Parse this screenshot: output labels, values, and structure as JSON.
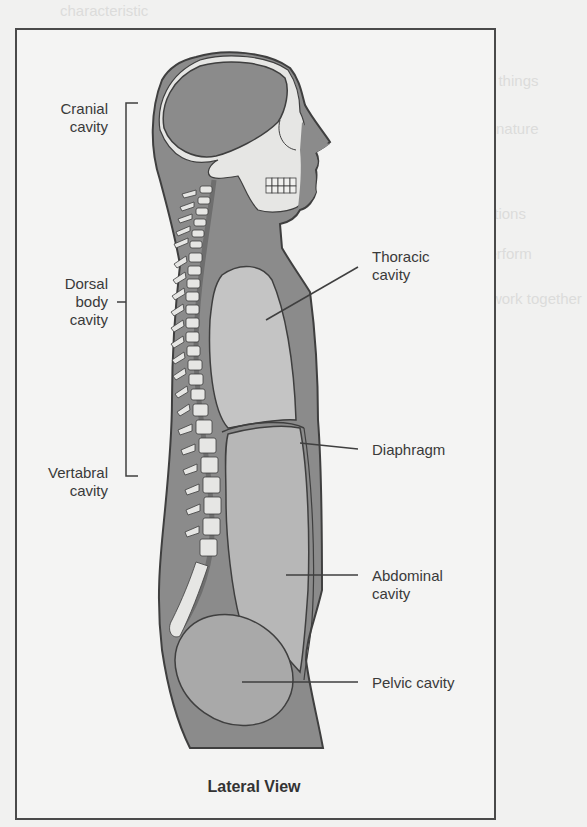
{
  "figure": {
    "caption": "Lateral View",
    "colors": {
      "body_fill": "#8b8b8b",
      "cavity_fill": "#b7b7b7",
      "thoracic_fill": "#c4c4c4",
      "bone_fill": "#e6e6e4",
      "outline": "#3f3f3f",
      "label_text": "#3a3a3a",
      "background": "#f4f4f3"
    },
    "labels_left": {
      "cranial": [
        "Cranial",
        "cavity"
      ],
      "dorsal": [
        "Dorsal",
        "body",
        "cavity"
      ],
      "vertebral": [
        "Vertabral",
        "cavity"
      ]
    },
    "labels_right": {
      "thoracic": [
        "Thoracic",
        "cavity"
      ],
      "diaphragm": [
        "Diaphragm"
      ],
      "abdominal": [
        "Abdominal",
        "cavity"
      ],
      "pelvic": [
        "Pelvic cavity"
      ]
    }
  },
  "background_bleed_text": [
    "characteristic",
    "ell lines of recognition; uses a map of ...",
    "ut 70 elements common to all living things",
    "nterfering with thinking, reflected in nature",
    "ells that perform specific functions",
    "of two or more tissues that perform",
    "em is a group of organs that work together"
  ]
}
